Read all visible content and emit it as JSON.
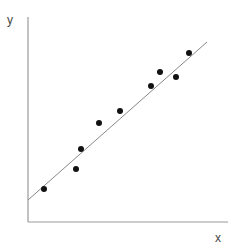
{
  "chart_data": {
    "type": "scatter",
    "title": "",
    "xlabel": "x",
    "ylabel": "y",
    "xlim": [
      0,
      20
    ],
    "ylim": [
      0,
      20.5
    ],
    "grid": false,
    "legend": null,
    "ticks": false,
    "series": [
      {
        "name": "observations",
        "marker": "circle",
        "color": "#111111",
        "points": [
          {
            "x": 1.6,
            "y": 3.3
          },
          {
            "x": 4.8,
            "y": 5.3
          },
          {
            "x": 5.3,
            "y": 7.3
          },
          {
            "x": 7.1,
            "y": 9.9
          },
          {
            "x": 9.2,
            "y": 11.1
          },
          {
            "x": 12.3,
            "y": 13.6
          },
          {
            "x": 13.2,
            "y": 15.0
          },
          {
            "x": 14.8,
            "y": 14.5
          },
          {
            "x": 16.1,
            "y": 16.9
          }
        ]
      }
    ],
    "trend_line": {
      "name": "fit",
      "color": "#888888",
      "x0": 0,
      "y0": 2.2,
      "x1": 17.9,
      "y1": 18.0
    }
  },
  "layout": {
    "origin_px": [
      28,
      222
    ],
    "px_per_unit": 10,
    "axis_color": "#999999"
  }
}
